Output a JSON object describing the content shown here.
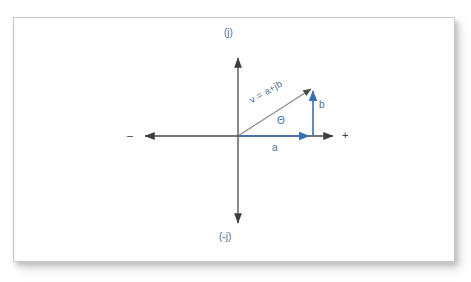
{
  "figure": {
    "title_visible": false,
    "background_color": "#ffffff",
    "card": {
      "border_color": "#c9c9c9",
      "fill_color": "#ffffff"
    }
  },
  "colors": {
    "axis": "#4a4a4a",
    "vector_gray": "#8a8a8a",
    "blue": "#3a6fb5",
    "label_blue": "#4a6f92",
    "label_dark": "#3c3c3c"
  },
  "axes": {
    "origin": {
      "x": 238,
      "y": 136
    },
    "vertical": {
      "name": "imaginary-axis",
      "top_label": "(j)",
      "bottom_label": "(-j)",
      "top_y": 55,
      "bottom_y": 226
    },
    "horizontal": {
      "name": "real-axis",
      "right_label": "+",
      "left_label": "–",
      "left_x": 142,
      "right_x": 336
    }
  },
  "vectors": [
    {
      "name": "resultant-vector",
      "label": "v = a+jb",
      "color": "#8a8a8a",
      "from": {
        "x": 238,
        "y": 136
      },
      "to": {
        "x": 313,
        "y": 87
      }
    },
    {
      "name": "real-component-vector",
      "label": "a",
      "color": "#3a6fb5",
      "from": {
        "x": 238,
        "y": 136
      },
      "to": {
        "x": 313,
        "y": 136
      }
    },
    {
      "name": "imaginary-component-vector",
      "label": "b",
      "color": "#3a6fb5",
      "from": {
        "x": 313,
        "y": 136
      },
      "to": {
        "x": 313,
        "y": 87
      }
    }
  ],
  "annotations": {
    "angle_label": "Θ"
  }
}
